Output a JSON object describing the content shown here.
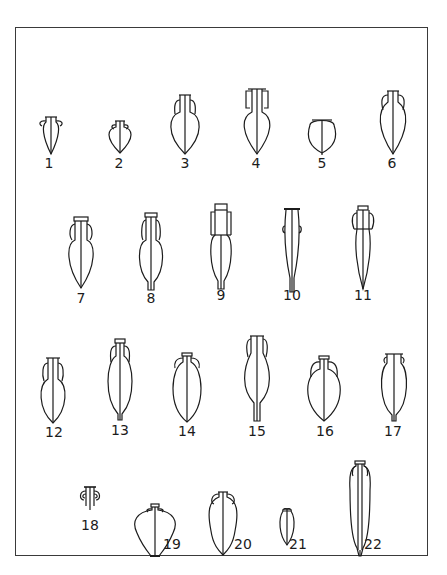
{
  "figure": {
    "type": "typology-plate",
    "ink_color": "#1c1c1c",
    "background": "#ffffff",
    "frame_color": "#3a3a3a"
  },
  "rows": [
    {
      "row": 1,
      "items": [
        "1",
        "2",
        "3",
        "4",
        "5",
        "6"
      ]
    },
    {
      "row": 2,
      "items": [
        "7",
        "8",
        "9",
        "10",
        "11"
      ]
    },
    {
      "row": 3,
      "items": [
        "12",
        "13",
        "14",
        "15",
        "16",
        "17"
      ]
    },
    {
      "row": 4,
      "items": [
        "18",
        "19",
        "20",
        "21",
        "22"
      ]
    }
  ],
  "amphorae": [
    {
      "id": "1",
      "label": "1"
    },
    {
      "id": "2",
      "label": "2"
    },
    {
      "id": "3",
      "label": "3"
    },
    {
      "id": "4",
      "label": "4"
    },
    {
      "id": "5",
      "label": "5"
    },
    {
      "id": "6",
      "label": "6"
    },
    {
      "id": "7",
      "label": "7"
    },
    {
      "id": "8",
      "label": "8"
    },
    {
      "id": "9",
      "label": "9"
    },
    {
      "id": "10",
      "label": "10"
    },
    {
      "id": "11",
      "label": "11"
    },
    {
      "id": "12",
      "label": "12"
    },
    {
      "id": "13",
      "label": "13"
    },
    {
      "id": "14",
      "label": "14"
    },
    {
      "id": "15",
      "label": "15"
    },
    {
      "id": "16",
      "label": "16"
    },
    {
      "id": "17",
      "label": "17"
    },
    {
      "id": "18",
      "label": "18"
    },
    {
      "id": "19",
      "label": "19"
    },
    {
      "id": "20",
      "label": "20"
    },
    {
      "id": "21",
      "label": "21"
    },
    {
      "id": "22",
      "label": "22"
    }
  ]
}
